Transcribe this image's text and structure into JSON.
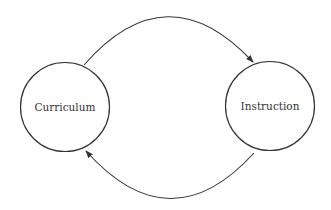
{
  "diagram": {
    "type": "cycle",
    "nodes": [
      {
        "id": "curriculum",
        "label": "Curriculum"
      },
      {
        "id": "instruction",
        "label": "Instruction"
      }
    ],
    "edges": [
      {
        "from": "curriculum",
        "to": "instruction",
        "position": "top"
      },
      {
        "from": "instruction",
        "to": "curriculum",
        "position": "bottom"
      }
    ],
    "colors": {
      "stroke": "#333333",
      "background": "#ffffff"
    }
  }
}
